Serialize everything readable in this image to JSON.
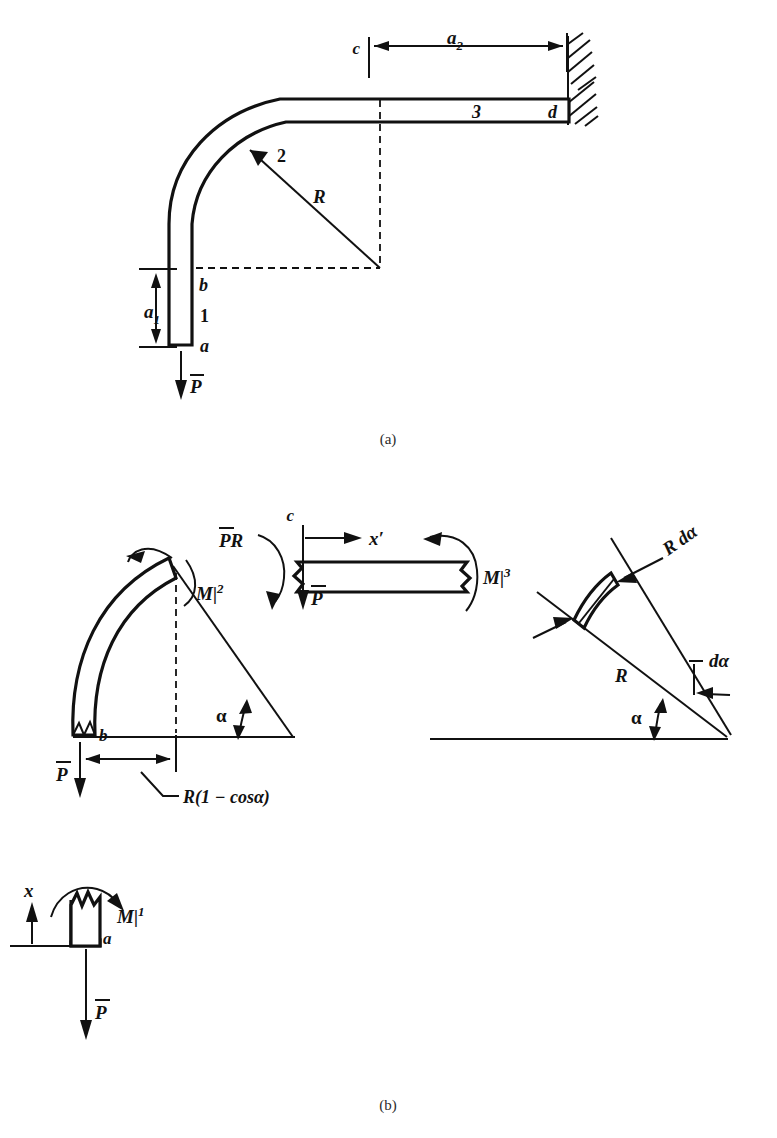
{
  "figure": {
    "title_fragment_top": "",
    "captions": {
      "part_a": "(a)",
      "part_b": "(b)"
    }
  },
  "part_a": {
    "name": "curved-cantilever-overview",
    "labels": {
      "dim_a1": "a",
      "dim_a1_sub": "1",
      "dim_a2": "a",
      "dim_a2_sub": "2",
      "radius": "R",
      "point_a": "a",
      "point_b": "b",
      "point_c": "c",
      "point_d": "d",
      "segment_1": "1",
      "segment_2": "2",
      "segment_3": "3",
      "load": "P",
      "load_overbar": true
    }
  },
  "part_b": {
    "fbd_curved": {
      "name": "free-body-segment-2",
      "labels": {
        "moment": "M",
        "moment_sep": "|",
        "moment_sup": "2",
        "point_b": "b",
        "angle": "α",
        "load": "P",
        "dimension": "R(1 − cosα)"
      }
    },
    "fbd_straight": {
      "name": "free-body-segment-3",
      "labels": {
        "point_c": "c",
        "axis": "x′",
        "moment": "M",
        "moment_sep": "|",
        "moment_sup": "3",
        "couple": "PR",
        "load": "P"
      }
    },
    "fbd_vertical": {
      "name": "free-body-segment-1",
      "labels": {
        "axis": "x",
        "moment": "M",
        "moment_sep": "|",
        "moment_sup": "1",
        "point_a": "a",
        "load": "P"
      }
    },
    "differential": {
      "name": "differential-arc-element",
      "labels": {
        "arc_length": "R dα",
        "radius": "R",
        "delta_angle": "dα",
        "angle": "α"
      }
    }
  },
  "colors": {
    "ink": "#111111",
    "paper": "#ffffff",
    "faint": "#c9c9c9"
  }
}
